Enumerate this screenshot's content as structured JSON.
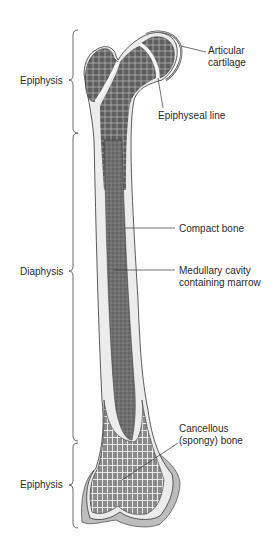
{
  "diagram": {
    "regions": [
      {
        "label": "Epiphysis",
        "position": "proximal"
      },
      {
        "label": "Diaphysis",
        "position": "shaft"
      },
      {
        "label": "Epiphysis",
        "position": "distal"
      }
    ],
    "structures": [
      {
        "lines": [
          "Articular",
          "cartilage"
        ]
      },
      {
        "lines": [
          "Epiphyseal line"
        ]
      },
      {
        "lines": [
          "Compact bone"
        ]
      },
      {
        "lines": [
          "Medullary cavity",
          "containing marrow"
        ]
      },
      {
        "lines": [
          "Cancellous",
          "(spongy) bone"
        ]
      }
    ]
  },
  "colors": {
    "background": "#ffffff",
    "line": "#333333",
    "text": "#2a2a2a",
    "spongy": "#6e6e6e",
    "marrow": "#7a7a7a",
    "compact": "#e6e6e6",
    "cartilage": "#bdbdbd"
  }
}
